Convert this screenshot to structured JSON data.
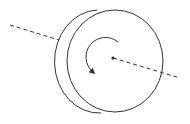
{
  "diagram": {
    "colors": {
      "stroke": "#333333",
      "background": "#ffffff"
    },
    "front_face": {
      "cx": 115,
      "cy": 61,
      "rx": 48,
      "ry": 51
    },
    "back_edge": {
      "path": "M 97 10 A 44 51 0 0 0 101 113"
    },
    "axis_left": {
      "x1": 10,
      "y1": 25,
      "x2": 59,
      "y2": 40
    },
    "axis_right": {
      "x1": 113,
      "y1": 58,
      "x2": 180,
      "y2": 78
    },
    "center_point": {
      "cx": 113,
      "cy": 58,
      "r": 1.6
    },
    "rotation_arrow": {
      "path": "M 118 42 A 18 18 0 0 0 93 72",
      "direction": "counterclockwise"
    }
  }
}
